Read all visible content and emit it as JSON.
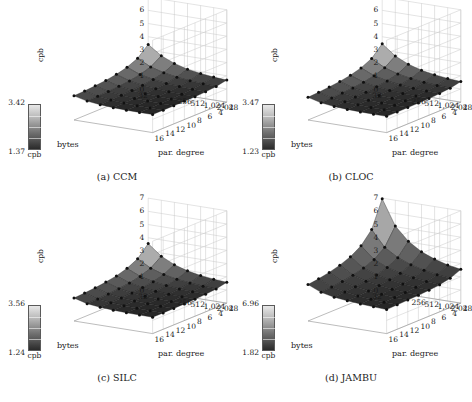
{
  "figure": {
    "panels": [
      {
        "id": "ccm",
        "caption": "(a) CCM",
        "colorbar": {
          "max": "3.42",
          "min": "1.37",
          "unit": "cpb"
        },
        "axes": {
          "zlabel": "cpb",
          "ylabel": "bytes",
          "xlabel": "par. degree",
          "zticks": [
            "7",
            "6",
            "5",
            "4",
            "3",
            "2",
            "1",
            "0"
          ],
          "yticks": [
            "32",
            "256",
            "512",
            "1,024",
            "2,048"
          ],
          "xticks": [
            "16",
            "14",
            "12",
            "10",
            "8",
            "6",
            "4",
            "2"
          ]
        }
      },
      {
        "id": "cloc",
        "caption": "(b) CLOC",
        "colorbar": {
          "max": "3.47",
          "min": "1.23",
          "unit": "cpb"
        },
        "axes": {
          "zlabel": "cpb",
          "ylabel": "bytes",
          "xlabel": "par. degree",
          "zticks": [
            "7",
            "6",
            "5",
            "4",
            "3",
            "2",
            "1",
            "0"
          ],
          "yticks": [
            "32",
            "256",
            "512",
            "1,024",
            "2,048"
          ],
          "xticks": [
            "16",
            "14",
            "12",
            "10",
            "8",
            "6",
            "4",
            "2"
          ]
        }
      },
      {
        "id": "silc",
        "caption": "(c) SILC",
        "colorbar": {
          "max": "3.56",
          "min": "1.24",
          "unit": "cpb"
        },
        "axes": {
          "zlabel": "cpb",
          "ylabel": "bytes",
          "xlabel": "par. degree",
          "zticks": [
            "7",
            "6",
            "5",
            "4",
            "3",
            "2",
            "1",
            "0"
          ],
          "yticks": [
            "32",
            "256",
            "512",
            "1,024",
            "2,048"
          ],
          "xticks": [
            "16",
            "14",
            "12",
            "10",
            "8",
            "6",
            "4",
            "2"
          ]
        }
      },
      {
        "id": "jambu",
        "caption": "(d) JAMBU",
        "colorbar": {
          "max": "6.96",
          "min": "1.82",
          "unit": "cpb"
        },
        "axes": {
          "zlabel": "cpb",
          "ylabel": "bytes",
          "xlabel": "par. degree",
          "zticks": [
            "7",
            "6",
            "5",
            "4",
            "3",
            "2",
            "1",
            "0"
          ],
          "yticks": [
            "32",
            "256",
            "512",
            "1,024",
            "2,048"
          ],
          "xticks": [
            "16",
            "14",
            "12",
            "10",
            "8",
            "6",
            "4",
            "2"
          ]
        }
      }
    ]
  },
  "chart_data": [
    {
      "type": "surface",
      "title": "(a) CCM",
      "xlabel": "par. degree",
      "ylabel": "bytes",
      "zlabel": "cpb",
      "colorbar": {
        "min": 1.37,
        "max": 3.42,
        "unit": "cpb",
        "colormap": "grayscale"
      },
      "zlim": [
        0,
        7
      ],
      "x": [
        2,
        4,
        6,
        8,
        10,
        12,
        14,
        16
      ],
      "y": [
        32,
        64,
        128,
        256,
        512,
        1024,
        2048
      ],
      "z": [
        [
          3.42,
          2.7,
          2.35,
          2.14,
          2.01,
          1.93,
          1.87,
          1.83
        ],
        [
          2.72,
          2.2,
          1.95,
          1.8,
          1.72,
          1.66,
          1.62,
          1.59
        ],
        [
          2.3,
          1.92,
          1.74,
          1.63,
          1.57,
          1.53,
          1.5,
          1.48
        ],
        [
          2.02,
          1.74,
          1.6,
          1.52,
          1.48,
          1.45,
          1.43,
          1.41
        ],
        [
          1.86,
          1.63,
          1.52,
          1.46,
          1.43,
          1.41,
          1.39,
          1.38
        ],
        [
          1.74,
          1.56,
          1.47,
          1.42,
          1.4,
          1.38,
          1.37,
          1.37
        ],
        [
          1.68,
          1.52,
          1.44,
          1.4,
          1.38,
          1.37,
          1.37,
          1.37
        ]
      ],
      "grid": true
    },
    {
      "type": "surface",
      "title": "(b) CLOC",
      "xlabel": "par. degree",
      "ylabel": "bytes",
      "zlabel": "cpb",
      "colorbar": {
        "min": 1.23,
        "max": 3.47,
        "unit": "cpb",
        "colormap": "grayscale"
      },
      "zlim": [
        0,
        7
      ],
      "x": [
        2,
        4,
        6,
        8,
        10,
        12,
        14,
        16
      ],
      "y": [
        32,
        64,
        128,
        256,
        512,
        1024,
        2048
      ],
      "z": [
        [
          3.47,
          2.68,
          2.3,
          2.07,
          1.93,
          1.84,
          1.77,
          1.72
        ],
        [
          2.7,
          2.14,
          1.86,
          1.7,
          1.6,
          1.54,
          1.49,
          1.46
        ],
        [
          2.24,
          1.83,
          1.63,
          1.51,
          1.44,
          1.4,
          1.37,
          1.34
        ],
        [
          1.94,
          1.64,
          1.49,
          1.4,
          1.35,
          1.32,
          1.3,
          1.28
        ],
        [
          1.76,
          1.52,
          1.4,
          1.33,
          1.29,
          1.27,
          1.26,
          1.25
        ],
        [
          1.64,
          1.44,
          1.34,
          1.29,
          1.26,
          1.25,
          1.24,
          1.23
        ],
        [
          1.56,
          1.39,
          1.31,
          1.27,
          1.25,
          1.24,
          1.23,
          1.23
        ]
      ],
      "grid": true
    },
    {
      "type": "surface",
      "title": "(c) SILC",
      "xlabel": "par. degree",
      "ylabel": "bytes",
      "zlabel": "cpb",
      "colorbar": {
        "min": 1.24,
        "max": 3.56,
        "unit": "cpb",
        "colormap": "grayscale"
      },
      "zlim": [
        0,
        7
      ],
      "x": [
        2,
        4,
        6,
        8,
        10,
        12,
        14,
        16
      ],
      "y": [
        32,
        64,
        128,
        256,
        512,
        1024,
        2048
      ],
      "z": [
        [
          3.56,
          2.74,
          2.34,
          2.1,
          1.96,
          1.86,
          1.79,
          1.74
        ],
        [
          2.76,
          2.18,
          1.89,
          1.72,
          1.62,
          1.55,
          1.5,
          1.47
        ],
        [
          2.28,
          1.86,
          1.65,
          1.53,
          1.46,
          1.41,
          1.38,
          1.36
        ],
        [
          1.97,
          1.66,
          1.51,
          1.42,
          1.37,
          1.34,
          1.31,
          1.3
        ],
        [
          1.78,
          1.54,
          1.42,
          1.35,
          1.31,
          1.29,
          1.27,
          1.26
        ],
        [
          1.66,
          1.46,
          1.36,
          1.31,
          1.28,
          1.26,
          1.25,
          1.25
        ],
        [
          1.58,
          1.41,
          1.33,
          1.29,
          1.26,
          1.25,
          1.24,
          1.24
        ]
      ],
      "grid": true
    },
    {
      "type": "surface",
      "title": "(d) JAMBU",
      "xlabel": "par. degree",
      "ylabel": "bytes",
      "zlabel": "cpb",
      "colorbar": {
        "min": 1.82,
        "max": 6.96,
        "unit": "cpb",
        "colormap": "grayscale"
      },
      "zlim": [
        0,
        7
      ],
      "x": [
        2,
        4,
        6,
        8,
        10,
        12,
        14,
        16
      ],
      "y": [
        32,
        64,
        128,
        256,
        512,
        1024,
        2048
      ],
      "z": [
        [
          6.96,
          4.95,
          4.05,
          3.55,
          3.24,
          3.02,
          2.87,
          2.76
        ],
        [
          5.05,
          3.76,
          3.17,
          2.85,
          2.64,
          2.5,
          2.4,
          2.33
        ],
        [
          4.05,
          3.14,
          2.72,
          2.49,
          2.35,
          2.25,
          2.18,
          2.12
        ],
        [
          3.42,
          2.76,
          2.45,
          2.28,
          2.17,
          2.1,
          2.05,
          2.01
        ],
        [
          3.02,
          2.5,
          2.27,
          2.13,
          2.05,
          2.0,
          1.96,
          1.93
        ],
        [
          2.74,
          2.33,
          2.14,
          2.03,
          1.97,
          1.92,
          1.89,
          1.87
        ],
        [
          2.56,
          2.21,
          2.06,
          1.97,
          1.91,
          1.88,
          1.85,
          1.82
        ]
      ],
      "grid": true
    }
  ]
}
